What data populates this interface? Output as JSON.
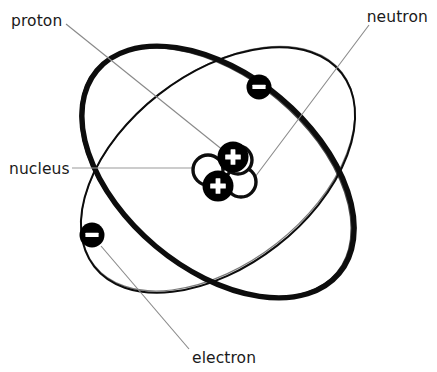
{
  "diagram": {
    "type": "hand-drawn atomic model",
    "background_color": "#ffffff",
    "ink_color": "#0d0d0d",
    "leader_color": "#8a8a8a",
    "labels": {
      "proton": "proton",
      "neutron": "neutron",
      "nucleus": "nucleus",
      "electron": "electron"
    },
    "particles": {
      "proton_glyph": "+",
      "electron_glyph": "−",
      "proton_count": 2,
      "neutron_count": 2,
      "electron_count": 2,
      "orbit_count": 2
    },
    "icon_names": {
      "proton": "proton-particle-icon",
      "neutron": "neutron-particle-icon",
      "electron": "electron-particle-icon",
      "orbit": "electron-orbit-icon",
      "nucleus": "nucleus-cluster-icon"
    }
  }
}
